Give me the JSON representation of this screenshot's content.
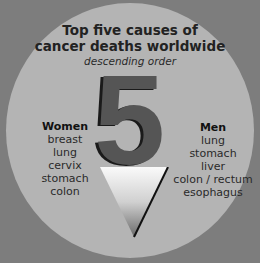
{
  "title": {
    "line1": "Top five causes of",
    "line2": "cancer deaths worldwide",
    "subtitle": "descending order"
  },
  "number": "5",
  "women": {
    "heading": "Women",
    "items": [
      "breast",
      "lung",
      "cervix",
      "stomach",
      "colon"
    ]
  },
  "men": {
    "heading": "Men",
    "items": [
      "lung",
      "stomach",
      "liver",
      "colon / rectum",
      "esophagus"
    ]
  },
  "colors": {
    "background": "#7d7d7d",
    "circle": "#b4b4b4",
    "numeral": "#555555"
  }
}
